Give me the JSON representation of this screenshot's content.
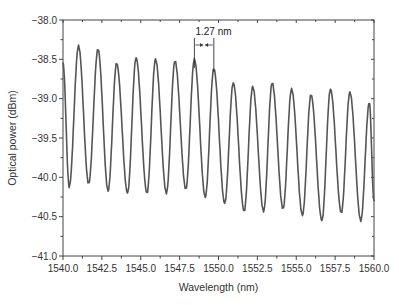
{
  "chart_data": {
    "type": "line",
    "title": "",
    "xlabel": "Wavelength (nm)",
    "ylabel": "Optical power (dBm)",
    "xlim": [
      1540.0,
      1560.0
    ],
    "ylim": [
      -41.0,
      -38.0
    ],
    "xticks": [
      1540.0,
      1542.5,
      1545.0,
      1547.5,
      1550.0,
      1552.5,
      1555.0,
      1557.5,
      1560.0
    ],
    "xtick_labels": [
      "1540.0",
      "1542.5",
      "1545.0",
      "1547.5",
      "1550.0",
      "1552.5",
      "1555.0",
      "1557.5",
      "1560.0"
    ],
    "yticks": [
      -38.0,
      -38.5,
      -39.0,
      -39.5,
      -40.0,
      -40.5,
      -41.0
    ],
    "ytick_labels": [
      "−38.0",
      "−38.5",
      "−39.0",
      "−39.5",
      "−40.0",
      "−40.5",
      "−41.0"
    ],
    "grid": false,
    "legend": null,
    "line_color": "#555555",
    "series": [
      {
        "name": "Optical spectrum",
        "peaks": [
          {
            "x": 1540.0,
            "y": -38.55
          },
          {
            "x": 1541.0,
            "y": -38.33
          },
          {
            "x": 1542.25,
            "y": -38.37
          },
          {
            "x": 1543.45,
            "y": -38.55
          },
          {
            "x": 1544.7,
            "y": -38.48
          },
          {
            "x": 1545.95,
            "y": -38.5
          },
          {
            "x": 1547.2,
            "y": -38.52
          },
          {
            "x": 1548.45,
            "y": -38.5
          },
          {
            "x": 1549.7,
            "y": -38.62
          },
          {
            "x": 1550.95,
            "y": -38.8
          },
          {
            "x": 1552.2,
            "y": -38.85
          },
          {
            "x": 1553.45,
            "y": -38.8
          },
          {
            "x": 1554.7,
            "y": -38.88
          },
          {
            "x": 1555.95,
            "y": -38.95
          },
          {
            "x": 1557.2,
            "y": -38.88
          },
          {
            "x": 1558.45,
            "y": -38.92
          },
          {
            "x": 1559.7,
            "y": -39.05
          }
        ],
        "troughs": [
          {
            "x": 1540.4,
            "y": -40.12
          },
          {
            "x": 1541.65,
            "y": -40.08
          },
          {
            "x": 1542.9,
            "y": -40.17
          },
          {
            "x": 1544.15,
            "y": -40.2
          },
          {
            "x": 1545.4,
            "y": -40.2
          },
          {
            "x": 1546.65,
            "y": -40.2
          },
          {
            "x": 1547.9,
            "y": -40.15
          },
          {
            "x": 1549.15,
            "y": -40.25
          },
          {
            "x": 1550.4,
            "y": -40.33
          },
          {
            "x": 1551.65,
            "y": -40.43
          },
          {
            "x": 1552.9,
            "y": -40.43
          },
          {
            "x": 1554.15,
            "y": -40.4
          },
          {
            "x": 1555.4,
            "y": -40.48
          },
          {
            "x": 1556.65,
            "y": -40.55
          },
          {
            "x": 1557.9,
            "y": -40.45
          },
          {
            "x": 1559.15,
            "y": -40.55
          }
        ]
      }
    ],
    "annotations": [
      {
        "text": "1.27 nm",
        "type": "spacing-arrow",
        "x_start": 1548.45,
        "x_end": 1549.7,
        "y": -38.32
      }
    ]
  }
}
